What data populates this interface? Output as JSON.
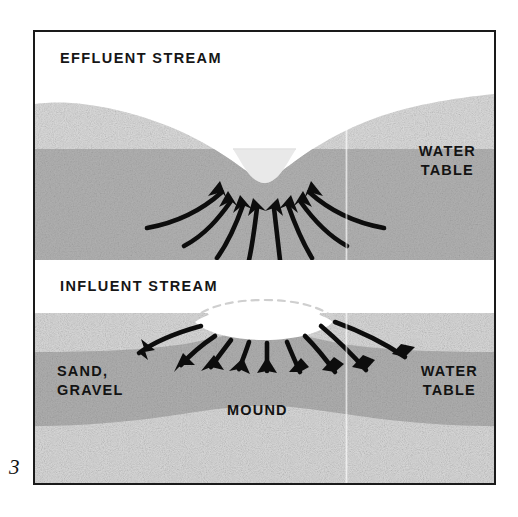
{
  "figure": {
    "number": "3",
    "type": "hydrogeologic cross-section diagram",
    "panels": [
      {
        "id": "effluent",
        "title": "EFFLUENT STREAM",
        "labels": [
          "WATER TABLE"
        ],
        "flow_direction": "groundwater flows inward and upward toward the stream channel",
        "arrow_count": 8
      },
      {
        "id": "influent",
        "title": "INFLUENT STREAM",
        "labels": [
          "SAND,",
          "GRAVEL",
          "MOUND",
          "WATER TABLE"
        ],
        "flow_direction": "water flows downward and outward away from the stream, forming a groundwater mound",
        "arrow_count": 9
      }
    ]
  },
  "panel_effluent": {
    "title": "EFFLUENT STREAM",
    "water_table_label_line1": "WATER",
    "water_table_label_line2": "TABLE"
  },
  "panel_influent": {
    "title": "INFLUENT STREAM",
    "sand_label_line1": "SAND,",
    "sand_label_line2": "GRAVEL",
    "mound_label": "MOUND",
    "water_table_label_line1": "WATER",
    "water_table_label_line2": "TABLE"
  },
  "colors": {
    "frame_border": "#1a1a1a",
    "background": "#ffffff",
    "saturated_zone": "#b4b4b4",
    "unsaturated_sand": "#d9d9d9",
    "deep_sand": "#cfcfcf",
    "water_surface": "#e8e8e8",
    "arrow": "#0d0d0d",
    "text": "#131313"
  }
}
